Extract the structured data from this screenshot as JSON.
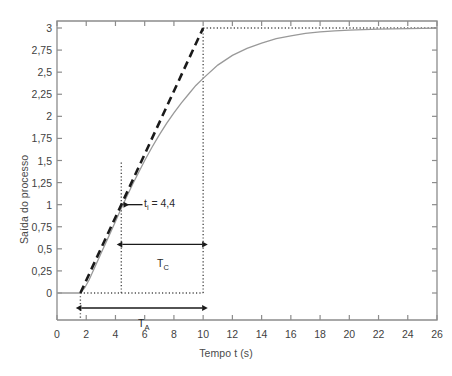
{
  "chart_data": {
    "type": "line",
    "title": "",
    "xlabel": "Tempo t (s)",
    "ylabel": "Saída do processo",
    "xlim": [
      0,
      26
    ],
    "ylim": [
      0,
      3.125
    ],
    "grid": false,
    "legend": null,
    "xticks": [
      "0",
      "2",
      "4",
      "6",
      "8",
      "10",
      "12",
      "14",
      "16",
      "18",
      "20",
      "22",
      "24",
      "26"
    ],
    "xtick_values": [
      0,
      2,
      4,
      6,
      8,
      10,
      12,
      14,
      16,
      18,
      20,
      22,
      24,
      26
    ],
    "yticks": [
      "0",
      "0,25",
      "0,5",
      "0,75",
      "1",
      "1,25",
      "1,5",
      "1,75",
      "2",
      "2,25",
      "2,5",
      "2,75",
      "3"
    ],
    "ytick_values": [
      0,
      0.25,
      0.5,
      0.75,
      1,
      1.25,
      1.5,
      1.75,
      2,
      2.25,
      2.5,
      2.75,
      3
    ],
    "series": [
      {
        "name": "resposta do processo",
        "style": "solid",
        "color": "#999999",
        "points": [
          [
            0,
            0
          ],
          [
            0.6,
            0
          ],
          [
            1.2,
            0
          ],
          [
            1.6,
            0.0
          ],
          [
            1.9,
            0.06
          ],
          [
            2.2,
            0.15
          ],
          [
            2.5,
            0.26
          ],
          [
            2.8,
            0.37
          ],
          [
            3.1,
            0.48
          ],
          [
            3.4,
            0.59
          ],
          [
            3.7,
            0.7
          ],
          [
            4.0,
            0.81
          ],
          [
            4.4,
            0.96
          ],
          [
            4.8,
            1.1
          ],
          [
            5.2,
            1.24
          ],
          [
            5.6,
            1.37
          ],
          [
            6.0,
            1.5
          ],
          [
            6.5,
            1.65
          ],
          [
            7.0,
            1.79
          ],
          [
            7.5,
            1.92
          ],
          [
            8.0,
            2.04
          ],
          [
            8.5,
            2.15
          ],
          [
            9.0,
            2.25
          ],
          [
            9.5,
            2.35
          ],
          [
            10.0,
            2.43
          ],
          [
            11.0,
            2.58
          ],
          [
            12.0,
            2.69
          ],
          [
            13.0,
            2.77
          ],
          [
            14.0,
            2.83
          ],
          [
            15.0,
            2.88
          ],
          [
            16.0,
            2.91
          ],
          [
            17.0,
            2.94
          ],
          [
            18.0,
            2.955
          ],
          [
            19.0,
            2.967
          ],
          [
            20.0,
            2.975
          ],
          [
            21.0,
            2.982
          ],
          [
            22.0,
            2.987
          ],
          [
            23.0,
            2.991
          ],
          [
            24.0,
            2.994
          ],
          [
            25.0,
            2.996
          ],
          [
            26.0,
            2.998
          ]
        ]
      },
      {
        "name": "reta tangente",
        "style": "dashed",
        "color": "#1a1a1a",
        "points": [
          [
            1.6,
            0
          ],
          [
            10.0,
            3.0
          ]
        ]
      }
    ],
    "guides": [
      {
        "name": "vertical-ti",
        "orientation": "vertical",
        "value": 4.4,
        "from": 0,
        "to": 1.5,
        "style": "dotted"
      },
      {
        "name": "vertical-t10",
        "orientation": "vertical",
        "value": 10.0,
        "from": 0,
        "to": 3.0,
        "style": "dotted"
      },
      {
        "name": "vertical-t16",
        "orientation": "vertical",
        "value": 1.6,
        "from": -0.28,
        "to": 0,
        "style": "dotted"
      },
      {
        "name": "horizontal-zero",
        "orientation": "horizontal",
        "value": 0,
        "from": 1.6,
        "to": 10.0,
        "style": "dotted"
      },
      {
        "name": "horizontal-ymax",
        "orientation": "horizontal",
        "value": 3.0,
        "from": 10.0,
        "to": 26.0,
        "style": "dotted"
      }
    ],
    "annotations": [
      {
        "name": "ti-label",
        "text": "t",
        "sub": "i",
        "suffix": " = 4,4",
        "x": 4.85,
        "y": 1.0,
        "arrow_from": 5.9,
        "arrow_to": 4.5
      },
      {
        "name": "tc-label",
        "text": "T",
        "sub": "C",
        "suffix": "",
        "x": 7.0,
        "y": 0.38,
        "arrow_from": 4.4,
        "arrow_to": 10.0,
        "arrow_y": 0.55
      },
      {
        "name": "ta-label",
        "text": "T",
        "sub": "A",
        "suffix": "",
        "x": 5.9,
        "y": -0.36,
        "arrow_from": 1.6,
        "arrow_to": 10.0,
        "arrow_y": -0.17
      }
    ]
  },
  "axis": {
    "x_title": "Tempo t (s)",
    "y_title": "Saída do processo"
  },
  "labels": {
    "ti_main": "t",
    "ti_sub": "i",
    "ti_value": " = 4,4",
    "tc_main": "T",
    "tc_sub": "C",
    "ta_main": "T",
    "ta_sub": "A"
  },
  "colors": {
    "curve": "#999999",
    "tangent": "#1a1a1a",
    "axis": "#8c8c8c",
    "guide": "#4d4d4d",
    "text": "#3a3a3a"
  }
}
